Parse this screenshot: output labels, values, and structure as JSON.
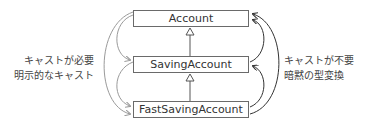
{
  "diagram": {
    "classes": [
      {
        "name": "Account"
      },
      {
        "name": "SavingAccount"
      },
      {
        "name": "FastSavingAccount"
      }
    ],
    "inheritance": [
      {
        "child": "SavingAccount",
        "parent": "Account"
      },
      {
        "child": "FastSavingAccount",
        "parent": "SavingAccount"
      }
    ],
    "left_annotation": {
      "line1": "キャストが必要",
      "line2": "明示的なキャスト",
      "direction": "downcast (parent to child)",
      "color": "#9a9a9a"
    },
    "right_annotation": {
      "line1": "キャストが不要",
      "line2": "暗黙の型変換",
      "direction": "upcast (child to parent)",
      "color": "#333333"
    }
  }
}
